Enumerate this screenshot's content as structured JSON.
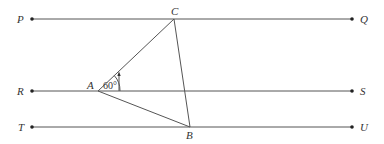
{
  "diagram": {
    "lines": [
      {
        "name": "PQ",
        "left_label": "P",
        "right_label": "Q",
        "y": 19
      },
      {
        "name": "RS",
        "left_label": "R",
        "right_label": "S",
        "y": 91
      },
      {
        "name": "TU",
        "left_label": "T",
        "right_label": "U",
        "y": 127
      }
    ],
    "points": {
      "A": {
        "label": "A",
        "x": 98,
        "y": 91
      },
      "B": {
        "label": "B",
        "x": 190,
        "y": 127
      },
      "C": {
        "label": "C",
        "x": 174,
        "y": 19
      }
    },
    "angle_label": "60°",
    "colors": {
      "line": "#555555",
      "dot": "#222222",
      "text": "#333333"
    }
  }
}
